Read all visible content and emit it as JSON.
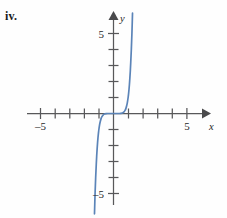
{
  "figure": {
    "part_label": "iv.",
    "curve_color": "#5b84b8",
    "axis_color": "#58585a"
  },
  "labels": {
    "x_axis_name": "x",
    "y_axis_name": "y",
    "x_neg_five": "–5",
    "x_pos_five": "5",
    "y_pos_five": "5",
    "y_neg_five": "–5"
  },
  "chart_data": {
    "type": "line",
    "title": "",
    "xlabel": "x",
    "ylabel": "y",
    "xlim": [
      -5.9,
      6.4
    ],
    "ylim": [
      -6.3,
      6.3
    ],
    "grid": false,
    "legend": "none",
    "x_ticks": [
      -5,
      -4,
      -3,
      -2,
      -1,
      1,
      2,
      3,
      4,
      5
    ],
    "y_ticks": [
      -5,
      -4,
      -3,
      -2,
      -1,
      1,
      2,
      3,
      4,
      5
    ],
    "x_tick_labels": {
      "-5": "–5",
      "5": "5"
    },
    "y_tick_labels": {
      "-5": "–5",
      "5": "5"
    },
    "series": [
      {
        "name": "y = x^7",
        "color": "#5b84b8",
        "x": [
          -1.3,
          -1.26,
          -1.22,
          -1.18,
          -1.15,
          -1.12,
          -1.09,
          -1.06,
          -1.03,
          -1.0,
          -0.95,
          -0.9,
          -0.85,
          -0.8,
          -0.7,
          -0.6,
          -0.5,
          -0.4,
          -0.3,
          -0.2,
          -0.1,
          0.0,
          0.1,
          0.2,
          0.3,
          0.4,
          0.5,
          0.6,
          0.7,
          0.8,
          0.85,
          0.9,
          0.95,
          1.0,
          1.03,
          1.06,
          1.09,
          1.12,
          1.15,
          1.18,
          1.22,
          1.26,
          1.3
        ],
        "y": [
          -6.27,
          -5.0,
          -4.02,
          -3.2,
          -2.66,
          -2.21,
          -1.83,
          -1.5,
          -1.23,
          -1.0,
          -0.7,
          -0.48,
          -0.32,
          -0.21,
          -0.08,
          -0.03,
          -0.01,
          0.0,
          0.0,
          0.0,
          0.0,
          0.0,
          0.0,
          0.0,
          0.0,
          0.0,
          0.01,
          0.03,
          0.08,
          0.21,
          0.32,
          0.48,
          0.7,
          1.0,
          1.23,
          1.5,
          1.83,
          2.21,
          2.66,
          3.2,
          4.02,
          5.0,
          6.27
        ]
      }
    ]
  }
}
